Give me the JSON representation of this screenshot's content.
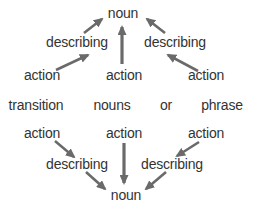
{
  "page": {
    "background_color": "#ffffff",
    "text_color": "#333333",
    "arrow_color": "#6a6a6a"
  },
  "top_tree": {
    "root": "noun",
    "left_mid": "describing",
    "right_mid": "describing",
    "left_leaf": "action",
    "center_leaf": "action",
    "right_leaf": "action"
  },
  "middle_row": {
    "word1": "transition",
    "word2": "nouns",
    "word3": "or",
    "word4": "phrase"
  },
  "bottom_tree": {
    "root": "noun",
    "left_mid": "describing",
    "right_mid": "describing",
    "left_leaf": "action",
    "center_leaf": "action",
    "right_leaf": "action"
  }
}
